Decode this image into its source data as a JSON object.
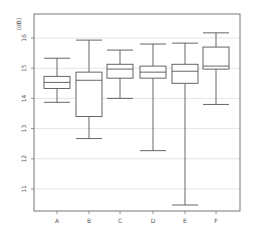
{
  "chart_data": {
    "type": "box",
    "title": "",
    "xlabel": "",
    "ylabel": "(dB)",
    "categories": [
      "A",
      "B",
      "C",
      "D",
      "E",
      "F"
    ],
    "yticks": [
      11,
      12,
      13,
      14,
      15,
      16
    ],
    "ylim": [
      10.3,
      16.8
    ],
    "grid": true,
    "legend": null,
    "series": [
      {
        "name": "A",
        "whisker_low": 13.87,
        "q1": 14.33,
        "median": 14.53,
        "q3": 14.73,
        "whisker_high": 15.33
      },
      {
        "name": "B",
        "whisker_low": 12.67,
        "q1": 13.4,
        "median": 14.6,
        "q3": 14.87,
        "whisker_high": 15.93
      },
      {
        "name": "C",
        "whisker_low": 14.0,
        "q1": 14.67,
        "median": 14.97,
        "q3": 15.13,
        "whisker_high": 15.6
      },
      {
        "name": "D",
        "whisker_low": 12.27,
        "q1": 14.67,
        "median": 14.87,
        "q3": 15.07,
        "whisker_high": 15.8
      },
      {
        "name": "E",
        "whisker_low": 10.47,
        "q1": 14.5,
        "median": 14.9,
        "q3": 15.13,
        "whisker_high": 15.83
      },
      {
        "name": "F",
        "whisker_low": 13.8,
        "q1": 14.97,
        "median": 15.07,
        "q3": 15.7,
        "whisker_high": 16.17
      }
    ]
  },
  "style": {
    "box_color": "#555555",
    "grid_color": "#dddddd",
    "frame_color": "#777777"
  }
}
